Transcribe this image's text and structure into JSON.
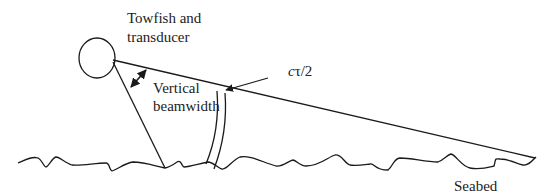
{
  "diagram": {
    "labels": {
      "towfish_line1": "Towfish and",
      "towfish_line2": "transducer",
      "beamwidth_line1": "Vertical",
      "beamwidth_line2": "beamwidth",
      "pulse_c": "c",
      "pulse_rest": "τ/2",
      "seabed": "Seabed"
    },
    "colors": {
      "stroke": "#1a1a1a",
      "text": "#222222",
      "background": "#ffffff"
    },
    "elements": [
      {
        "id": "towfish",
        "shape": "ellipse"
      },
      {
        "id": "beam-lower-edge",
        "shape": "line"
      },
      {
        "id": "beam-upper-edge",
        "shape": "line"
      },
      {
        "id": "vertical-beamwidth-arrow",
        "shape": "double-arrow"
      },
      {
        "id": "pulse-footprint",
        "shape": "band"
      },
      {
        "id": "pulse-pointer-arrow",
        "shape": "arrow"
      },
      {
        "id": "seabed",
        "shape": "wavy-line"
      }
    ]
  }
}
